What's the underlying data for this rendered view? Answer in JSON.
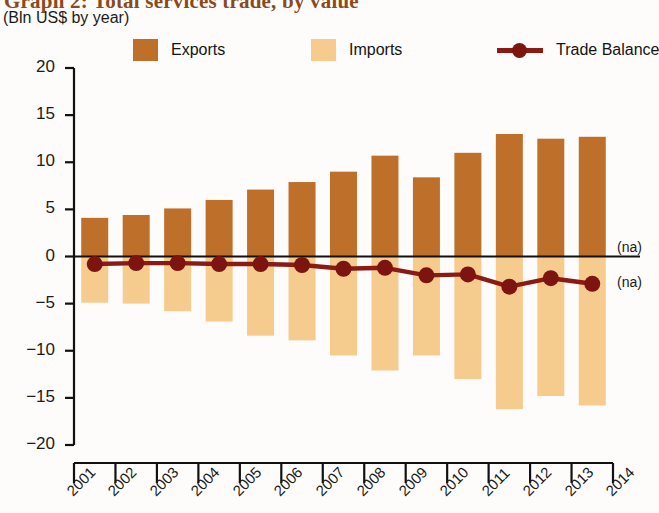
{
  "header": {
    "title": "Graph 2: Total services trade, by value",
    "subtitle": "(Bln US$ by year)",
    "title_color": "#8a4a1c"
  },
  "legend": {
    "position": "top",
    "items": [
      {
        "label": "Exports",
        "color": "#BE6F2A",
        "marker": "square-swatch"
      },
      {
        "label": "Imports",
        "color": "#F5CB8E",
        "marker": "square-swatch"
      },
      {
        "label": "Trade Balance",
        "color": "#8B1A14",
        "marker": "line-with-circle"
      }
    ]
  },
  "annotations": [
    {
      "text": "(na)",
      "x_year": 2014,
      "y_value": 0.9
    },
    {
      "text": "(na)",
      "x_year": 2014,
      "y_value": -2.8
    }
  ],
  "chart_data": {
    "type": "bar",
    "title": "Graph 2: Total services trade, by value",
    "subtitle": "(Bln US$ by year)",
    "xlabel": "",
    "ylabel": "",
    "ylim": [
      -20,
      20
    ],
    "yticks": [
      20,
      15,
      10,
      5,
      0,
      -5,
      -10,
      -15,
      -20
    ],
    "ytick_labels": [
      "20",
      "15",
      "10",
      "5",
      "0",
      "−5",
      "−10",
      "−15",
      "−20"
    ],
    "xticks": [
      2001,
      2002,
      2003,
      2004,
      2005,
      2006,
      2007,
      2008,
      2009,
      2010,
      2011,
      2012,
      2013,
      2014
    ],
    "xtick_labels": [
      "2001",
      "2002",
      "2003",
      "2004",
      "2005",
      "2006",
      "2007",
      "2008",
      "2009",
      "2010",
      "2011",
      "2012",
      "2013",
      "2014"
    ],
    "categories": [
      "2001",
      "2002",
      "2003",
      "2004",
      "2005",
      "2006",
      "2007",
      "2008",
      "2009",
      "2010",
      "2011",
      "2012",
      "2013"
    ],
    "grid": false,
    "zero_line": true,
    "series": [
      {
        "name": "Exports",
        "type": "bar",
        "color": "#BE6F2A",
        "values": [
          4.1,
          4.4,
          5.1,
          6.0,
          7.1,
          7.9,
          9.0,
          10.7,
          8.4,
          11.0,
          13.0,
          12.5,
          12.7
        ]
      },
      {
        "name": "Imports",
        "type": "bar",
        "color": "#F5CB8E",
        "values": [
          -4.9,
          -5.0,
          -5.8,
          -6.9,
          -8.4,
          -8.9,
          -10.5,
          -12.1,
          -10.5,
          -13.0,
          -16.2,
          -14.8,
          -15.8
        ]
      },
      {
        "name": "Trade Balance",
        "type": "line",
        "color": "#8B1A14",
        "values": [
          -0.8,
          -0.7,
          -0.7,
          -0.8,
          -0.8,
          -0.9,
          -1.3,
          -1.2,
          -2.0,
          -1.9,
          -3.2,
          -2.3,
          -2.9
        ]
      }
    ]
  }
}
